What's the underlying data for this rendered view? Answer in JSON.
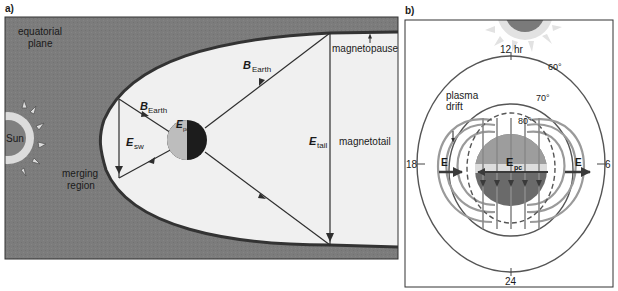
{
  "panel_a": {
    "label": "a)",
    "plane_label_line1": "equatorial",
    "plane_label_line2": "plane",
    "sun_label": "Sun",
    "merging_line1": "merging",
    "merging_line2": "region",
    "magnetopause_label": "magnetopause",
    "magnetotail_label": "magnetotail",
    "b_earth_symbol": "B",
    "b_earth_sub": "Earth",
    "e_sw_symbol": "E",
    "e_sw_sub": "sw",
    "e_pc_symbol": "E",
    "e_pc_sub": "pc",
    "e_tail_symbol": "E",
    "e_tail_sub": "tail"
  },
  "panel_b": {
    "label": "b)",
    "noon_label": "12 hr",
    "midnight_label": "24",
    "dusk_label": "18",
    "dawn_label": "6",
    "lat_60": "60°",
    "lat_70": "70°",
    "lat_80": "80°",
    "plasma_line1": "plasma",
    "plasma_line2": "drift",
    "e_left": "E",
    "e_right": "E",
    "e_pc_symbol": "E",
    "e_pc_sub": "pc"
  },
  "colors": {
    "background_gray": "#7a7a7a",
    "magnetosphere_fill": "#efefef",
    "boundary": "#3a3a3a",
    "line": "#2e2e2e",
    "sun_glow": "#d9d9d9"
  }
}
